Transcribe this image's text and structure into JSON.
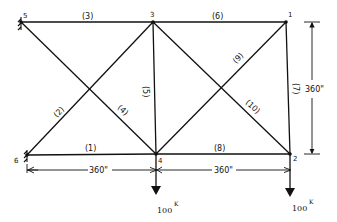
{
  "diagram": {
    "type": "truss",
    "nodes": [
      {
        "id": "1",
        "label": "1",
        "x": 286,
        "y": 22
      },
      {
        "id": "2",
        "label": "2",
        "x": 290,
        "y": 154
      },
      {
        "id": "3",
        "label": "3",
        "x": 153,
        "y": 22
      },
      {
        "id": "4",
        "label": "4",
        "x": 156,
        "y": 154
      },
      {
        "id": "5",
        "label": "5",
        "x": 21,
        "y": 22
      },
      {
        "id": "6",
        "label": "6",
        "x": 27,
        "y": 155
      }
    ],
    "members": [
      {
        "id": "1",
        "label": "(1)",
        "from": "6",
        "to": "4"
      },
      {
        "id": "2",
        "label": "(2)",
        "from": "6",
        "to": "3"
      },
      {
        "id": "3",
        "label": "(3)",
        "from": "5",
        "to": "3"
      },
      {
        "id": "4",
        "label": "(4)",
        "from": "5",
        "to": "4"
      },
      {
        "id": "5",
        "label": "(5)",
        "from": "3",
        "to": "4"
      },
      {
        "id": "6",
        "label": "(6)",
        "from": "3",
        "to": "1"
      },
      {
        "id": "7",
        "label": "(7)",
        "from": "1",
        "to": "2"
      },
      {
        "id": "8",
        "label": "(8)",
        "from": "4",
        "to": "2"
      },
      {
        "id": "9",
        "label": "(9)",
        "from": "4",
        "to": "1"
      },
      {
        "id": "10",
        "label": "(10)",
        "from": "3",
        "to": "2"
      }
    ],
    "supports": [
      {
        "node": "5",
        "type": "pin"
      },
      {
        "node": "6",
        "type": "pin"
      }
    ],
    "dimensions": {
      "bay_left": "360\"",
      "bay_right": "360\"",
      "height": "360\""
    },
    "loads": [
      {
        "node": "4",
        "value": "100",
        "unit": "K"
      },
      {
        "node": "2",
        "value": "100",
        "unit": "K"
      }
    ]
  }
}
